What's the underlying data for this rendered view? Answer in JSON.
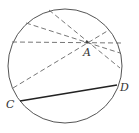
{
  "diagram": {
    "type": "geometry",
    "circle": {
      "cx": 65,
      "cy": 66,
      "r": 57,
      "stroke": "#555555"
    },
    "point_A": {
      "label": "A",
      "x": 87,
      "y": 42
    },
    "dashed_chords_through_A": [
      {
        "from": [
          49,
          10
        ],
        "to": [
          120,
          68
        ]
      },
      {
        "from": [
          26,
          23
        ],
        "to": [
          120,
          53
        ]
      },
      {
        "from": [
          12,
          42
        ],
        "to": [
          121,
          43
        ]
      },
      {
        "from": [
          13,
          88
        ],
        "to": [
          109,
          30
        ]
      }
    ],
    "solid_chord": {
      "label_start": "C",
      "label_end": "D",
      "from": [
        20,
        101
      ],
      "to": [
        117,
        85
      ],
      "stroke": "#222222"
    },
    "labels": {
      "A": "A",
      "C": "C",
      "D": "D"
    }
  }
}
